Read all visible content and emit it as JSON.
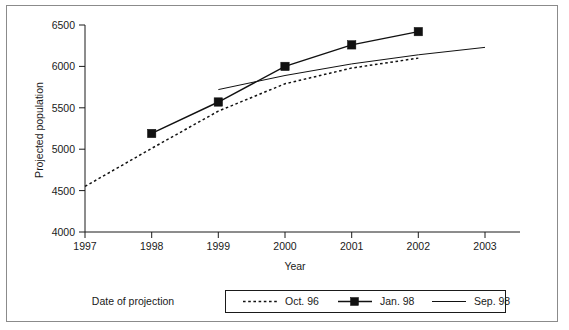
{
  "chart_data": {
    "type": "line",
    "title": "",
    "xlabel": "Year",
    "ylabel": "Projected population",
    "x": [
      1997,
      1998,
      1999,
      2000,
      2001,
      2002,
      2003
    ],
    "xtick_labels": [
      "1997",
      "1998",
      "1999",
      "2000",
      "2001",
      "2002",
      "2003"
    ],
    "ytick_labels": [
      "4000",
      "4500",
      "5000",
      "5500",
      "6000",
      "6500"
    ],
    "yticks": [
      4000,
      4500,
      5000,
      5500,
      6000,
      6500
    ],
    "xlim": [
      1997,
      2003
    ],
    "ylim": [
      4000,
      6500
    ],
    "grid": false,
    "legend_position": "below-plot",
    "legend_title": "Date of projection",
    "series": [
      {
        "name": "Oct. 96",
        "style": "dotted",
        "marker": "none",
        "color": "#111111",
        "x": [
          1997,
          1998,
          1999,
          2000,
          2001,
          2002
        ],
        "values": [
          4550,
          5010,
          5460,
          5790,
          5980,
          6100
        ]
      },
      {
        "name": "Jan. 98",
        "style": "solid",
        "marker": "square",
        "color": "#111111",
        "x": [
          1998,
          1999,
          2000,
          2001,
          2002
        ],
        "values": [
          5190,
          5570,
          6000,
          6260,
          6420
        ]
      },
      {
        "name": "Sep. 98",
        "style": "solid-thin",
        "marker": "none",
        "color": "#111111",
        "x": [
          1999,
          2000,
          2001,
          2002,
          2003
        ],
        "values": [
          5720,
          5890,
          6030,
          6140,
          6230
        ]
      }
    ]
  },
  "axes": {
    "y_title": "Projected population",
    "x_title": "Year"
  },
  "legend": {
    "title": "Date of projection",
    "entries": [
      {
        "label": "Oct. 96"
      },
      {
        "label": "Jan. 98"
      },
      {
        "label": "Sep. 98"
      }
    ]
  }
}
